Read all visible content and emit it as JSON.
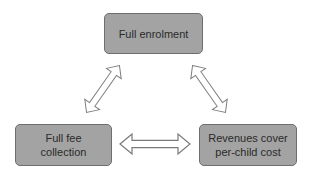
{
  "diagram": {
    "type": "cycle-triangle",
    "nodes": [
      {
        "id": "top",
        "label": "Full enrolment"
      },
      {
        "id": "left",
        "label": "Full fee\ncollection"
      },
      {
        "id": "right",
        "label": "Revenues cover\nper-child cost"
      }
    ],
    "edges": [
      {
        "from": "top",
        "to": "left",
        "style": "double-headed-hollow-arrow"
      },
      {
        "from": "top",
        "to": "right",
        "style": "double-headed-hollow-arrow"
      },
      {
        "from": "left",
        "to": "right",
        "style": "double-headed-hollow-arrow"
      }
    ],
    "colors": {
      "node_fill": "#a3a3a3",
      "node_border": "#6e6e6e",
      "arrow_stroke": "#7a7a7a",
      "arrow_fill": "#ffffff",
      "text": "#2a2a2a"
    }
  }
}
